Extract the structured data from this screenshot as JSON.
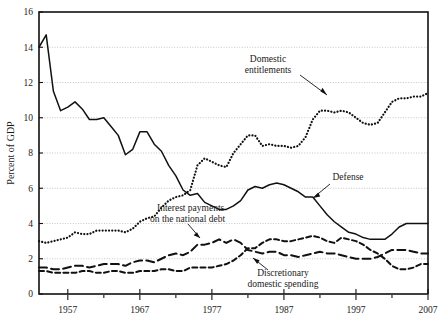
{
  "chart_data": {
    "type": "line",
    "title": "",
    "xlabel": "",
    "ylabel": "Percent of GDP",
    "xlim": [
      1953,
      2007
    ],
    "ylim": [
      0,
      16
    ],
    "grid": true,
    "legend_position": "inline-annotations",
    "yticks": [
      "0",
      "2",
      "4",
      "6",
      "8",
      "10",
      "12",
      "14",
      "16"
    ],
    "ytick_values": [
      0,
      2,
      4,
      6,
      8,
      10,
      12,
      14,
      16
    ],
    "xticks": [
      "1957",
      "1967",
      "1977",
      "1987",
      "1997",
      "2007"
    ],
    "xtick_values": [
      1957,
      1967,
      1977,
      1987,
      1997,
      2007
    ],
    "xminor_values": [
      1962,
      1972,
      1982,
      1992,
      2002
    ],
    "x": [
      1953,
      1954,
      1955,
      1956,
      1957,
      1958,
      1959,
      1960,
      1961,
      1962,
      1963,
      1964,
      1965,
      1966,
      1967,
      1968,
      1969,
      1970,
      1971,
      1972,
      1973,
      1974,
      1975,
      1976,
      1977,
      1978,
      1979,
      1980,
      1981,
      1982,
      1983,
      1984,
      1985,
      1986,
      1987,
      1988,
      1989,
      1990,
      1991,
      1992,
      1993,
      1994,
      1995,
      1996,
      1997,
      1998,
      1999,
      2000,
      2001,
      2002,
      2003,
      2004,
      2005,
      2006,
      2007
    ],
    "series": [
      {
        "name": "Defense",
        "style": "solid",
        "values": [
          14.0,
          14.7,
          11.5,
          10.4,
          10.6,
          10.9,
          10.5,
          9.9,
          9.9,
          10.0,
          9.5,
          9.0,
          7.9,
          8.2,
          9.2,
          9.2,
          8.5,
          8.1,
          7.3,
          6.7,
          5.9,
          5.6,
          5.7,
          5.2,
          5.0,
          4.8,
          4.8,
          5.0,
          5.3,
          5.9,
          6.1,
          6.0,
          6.2,
          6.3,
          6.2,
          6.0,
          5.8,
          5.5,
          5.5,
          5.0,
          4.5,
          4.1,
          3.8,
          3.5,
          3.4,
          3.2,
          3.1,
          3.1,
          3.1,
          3.4,
          3.8,
          4.0,
          4.0,
          4.0,
          4.0
        ],
        "label": "Defense",
        "label_x": 348,
        "label_y": 180
      },
      {
        "name": "Domestic entitlements",
        "style": "dotted",
        "values": [
          3.0,
          2.9,
          3.0,
          3.1,
          3.2,
          3.5,
          3.4,
          3.4,
          3.6,
          3.6,
          3.6,
          3.6,
          3.5,
          3.7,
          4.1,
          4.3,
          4.4,
          4.9,
          5.3,
          5.5,
          5.6,
          5.9,
          7.3,
          7.7,
          7.5,
          7.3,
          7.2,
          8.0,
          8.5,
          9.0,
          9.0,
          8.4,
          8.5,
          8.4,
          8.4,
          8.3,
          8.4,
          8.9,
          9.9,
          10.4,
          10.4,
          10.3,
          10.4,
          10.3,
          10.0,
          9.7,
          9.6,
          9.7,
          10.3,
          10.9,
          11.1,
          11.1,
          11.2,
          11.2,
          11.4
        ],
        "label": "Domestic entitlements",
        "label_x": 268,
        "label_y": 62
      },
      {
        "name": "Interest payments on the national debt",
        "style": "dashed-short",
        "values": [
          1.3,
          1.3,
          1.2,
          1.2,
          1.2,
          1.2,
          1.3,
          1.3,
          1.2,
          1.2,
          1.3,
          1.3,
          1.2,
          1.2,
          1.3,
          1.3,
          1.3,
          1.4,
          1.4,
          1.3,
          1.3,
          1.5,
          1.5,
          1.5,
          1.5,
          1.6,
          1.7,
          1.9,
          2.2,
          2.6,
          2.6,
          2.9,
          3.1,
          3.1,
          3.0,
          3.0,
          3.1,
          3.2,
          3.3,
          3.2,
          3.0,
          2.9,
          3.2,
          3.1,
          3.0,
          2.8,
          2.5,
          2.3,
          2.0,
          1.6,
          1.4,
          1.4,
          1.5,
          1.7,
          1.7
        ],
        "label_line1": "Interest payments",
        "label_line2": "on the national debt",
        "label_x": 157,
        "label_y": 208
      },
      {
        "name": "Discretionary domestic spending",
        "style": "dashed-long",
        "values": [
          1.5,
          1.5,
          1.4,
          1.4,
          1.5,
          1.6,
          1.6,
          1.5,
          1.6,
          1.7,
          1.7,
          1.7,
          1.6,
          1.8,
          1.9,
          1.9,
          1.8,
          2.0,
          2.2,
          2.3,
          2.2,
          2.4,
          2.8,
          2.8,
          2.9,
          3.1,
          2.9,
          3.1,
          2.9,
          2.5,
          2.4,
          2.3,
          2.4,
          2.4,
          2.2,
          2.2,
          2.1,
          2.2,
          2.3,
          2.4,
          2.3,
          2.3,
          2.2,
          2.1,
          2.0,
          2.0,
          2.0,
          2.1,
          2.3,
          2.5,
          2.5,
          2.5,
          2.4,
          2.3,
          2.3
        ],
        "label_line1": "Discretionary",
        "label_line2": "domestic spending",
        "label_x": 283,
        "label_y": 272
      }
    ]
  },
  "colors": {
    "line": "#111111",
    "grid": "#b9b9b9",
    "background": "#ffffff",
    "text": "#1a1a1a"
  }
}
